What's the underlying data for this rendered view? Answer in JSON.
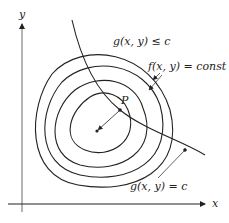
{
  "diagram": {
    "axes": {
      "x_label": "x",
      "y_label": "y"
    },
    "labels": {
      "feasible_region": "g(x, y) ≤ c",
      "level_curves": "f(x, y) = const",
      "constraint_curve": "g(x, y) = c",
      "point": "P"
    },
    "contours": {
      "count": 4,
      "description": "nested level curves of f around an interior center point"
    },
    "colors": {
      "stroke": "#222222",
      "background": "#ffffff"
    }
  }
}
